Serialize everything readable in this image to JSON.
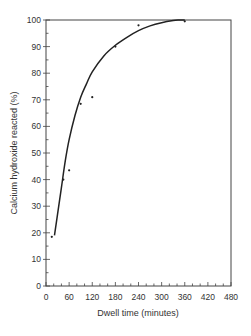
{
  "chart_data": {
    "type": "scatter",
    "title": "",
    "xlabel": "Dwell time (minutes)",
    "ylabel": "Calcium hydroxide reacted (%)",
    "xlim": [
      0,
      480
    ],
    "ylim": [
      0,
      100
    ],
    "xticks": [
      0,
      60,
      120,
      180,
      240,
      300,
      360,
      420,
      480
    ],
    "yticks": [
      0,
      10,
      20,
      30,
      40,
      50,
      60,
      70,
      80,
      90,
      100
    ],
    "grid": false,
    "legend": null,
    "series": [
      {
        "name": "Measured",
        "kind": "points",
        "x": [
          15,
          45,
          60,
          90,
          120,
          180,
          240,
          360
        ],
        "y": [
          18.5,
          40,
          43.5,
          68.5,
          71,
          90,
          98,
          99.5
        ]
      },
      {
        "name": "Fitted curve",
        "kind": "line",
        "x": [
          22,
          30,
          40,
          50,
          60,
          75,
          90,
          105,
          120,
          150,
          180,
          210,
          240,
          270,
          300,
          330,
          345
        ],
        "y": [
          19,
          27,
          37,
          47,
          55,
          64,
          71,
          76,
          80.5,
          86.5,
          90.5,
          93.5,
          96,
          97.8,
          99,
          99.8,
          100
        ]
      }
    ]
  },
  "frame": {
    "left": 46,
    "top": 20,
    "right": 231,
    "bottom": 286
  },
  "colors": {
    "line": "#222222",
    "axis": "#444444",
    "point": "#222222"
  }
}
